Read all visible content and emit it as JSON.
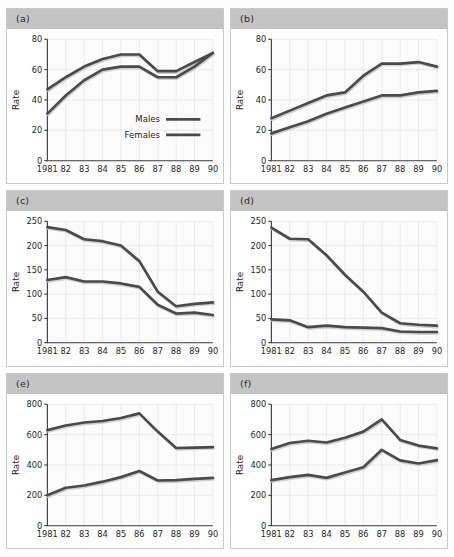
{
  "figure": {
    "series_names": [
      "Males",
      "Females"
    ],
    "y_axis_label": "Rate",
    "x_categories": [
      "1981",
      "82",
      "83",
      "84",
      "85",
      "86",
      "87",
      "88",
      "89",
      "90"
    ],
    "line_color": "#4a4a4a",
    "header_color": "#c4c4c4",
    "panel_border_color": "#c9c9c9"
  },
  "chart_data": [
    {
      "type": "line",
      "panel": "(a)",
      "title": "",
      "xlabel": "",
      "ylabel": "Rate",
      "x": [
        "1981",
        "82",
        "83",
        "84",
        "85",
        "86",
        "87",
        "88",
        "89",
        "90"
      ],
      "ylim": [
        0,
        80
      ],
      "yticks": [
        0,
        20,
        40,
        60,
        80
      ],
      "grid": true,
      "legend": "inside-lower-right",
      "series": [
        {
          "name": "Males",
          "values": [
            47,
            55,
            62,
            67,
            70,
            70,
            59,
            59,
            65,
            71
          ]
        },
        {
          "name": "Females",
          "values": [
            31,
            43,
            53,
            60,
            62,
            62,
            55,
            55,
            62,
            71
          ]
        }
      ]
    },
    {
      "type": "line",
      "panel": "(b)",
      "title": "",
      "xlabel": "",
      "ylabel": "Rate",
      "x": [
        "1981",
        "82",
        "83",
        "84",
        "85",
        "86",
        "87",
        "88",
        "89",
        "90"
      ],
      "ylim": [
        0,
        80
      ],
      "yticks": [
        0,
        20,
        40,
        60,
        80
      ],
      "grid": true,
      "legend": "none",
      "series": [
        {
          "name": "Males",
          "values": [
            28,
            33,
            38,
            43,
            45,
            56,
            64,
            64,
            65,
            62
          ]
        },
        {
          "name": "Females",
          "values": [
            18,
            22,
            26,
            31,
            35,
            39,
            43,
            43,
            45,
            46
          ]
        }
      ]
    },
    {
      "type": "line",
      "panel": "(c)",
      "title": "",
      "xlabel": "",
      "ylabel": "Rate",
      "x": [
        "1981",
        "82",
        "83",
        "84",
        "85",
        "86",
        "87",
        "88",
        "89",
        "90"
      ],
      "ylim": [
        0,
        250
      ],
      "yticks": [
        0,
        50,
        100,
        150,
        200,
        250
      ],
      "grid": true,
      "legend": "none",
      "series": [
        {
          "name": "Males",
          "values": [
            238,
            232,
            213,
            209,
            200,
            168,
            105,
            75,
            80,
            83
          ]
        },
        {
          "name": "Females",
          "values": [
            129,
            135,
            126,
            126,
            122,
            115,
            78,
            60,
            62,
            57
          ]
        }
      ]
    },
    {
      "type": "line",
      "panel": "(d)",
      "title": "",
      "xlabel": "",
      "ylabel": "Rate",
      "x": [
        "1981",
        "82",
        "83",
        "84",
        "85",
        "86",
        "87",
        "88",
        "89",
        "90"
      ],
      "ylim": [
        0,
        250
      ],
      "yticks": [
        0,
        50,
        100,
        150,
        200,
        250
      ],
      "grid": true,
      "legend": "none",
      "series": [
        {
          "name": "Males",
          "values": [
            237,
            214,
            213,
            180,
            140,
            105,
            62,
            40,
            37,
            35
          ]
        },
        {
          "name": "Females",
          "values": [
            48,
            46,
            32,
            35,
            32,
            31,
            30,
            23,
            22,
            22
          ]
        }
      ]
    },
    {
      "type": "line",
      "panel": "(e)",
      "title": "",
      "xlabel": "",
      "ylabel": "Rate",
      "x": [
        "1981",
        "82",
        "83",
        "84",
        "85",
        "86",
        "87",
        "88",
        "89",
        "90"
      ],
      "ylim": [
        0,
        800
      ],
      "yticks": [
        0,
        200,
        400,
        600,
        800
      ],
      "grid": true,
      "legend": "none",
      "series": [
        {
          "name": "Males",
          "values": [
            630,
            660,
            680,
            690,
            710,
            740,
            620,
            512,
            515,
            518
          ]
        },
        {
          "name": "Females",
          "values": [
            200,
            250,
            265,
            290,
            320,
            360,
            298,
            300,
            308,
            315
          ]
        }
      ]
    },
    {
      "type": "line",
      "panel": "(f)",
      "title": "",
      "xlabel": "",
      "ylabel": "Rate",
      "x": [
        "1981",
        "82",
        "83",
        "84",
        "85",
        "86",
        "87",
        "88",
        "89",
        "90"
      ],
      "ylim": [
        0,
        800
      ],
      "yticks": [
        0,
        200,
        400,
        600,
        800
      ],
      "grid": true,
      "legend": "none",
      "series": [
        {
          "name": "Males",
          "values": [
            505,
            545,
            560,
            548,
            580,
            620,
            700,
            565,
            528,
            510
          ]
        },
        {
          "name": "Females",
          "values": [
            300,
            320,
            335,
            315,
            350,
            385,
            500,
            430,
            410,
            432
          ]
        }
      ]
    }
  ]
}
